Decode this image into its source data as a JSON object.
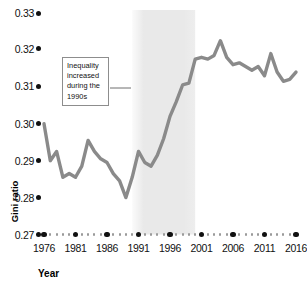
{
  "chart_data": {
    "type": "line",
    "title": "",
    "xlabel": "Year",
    "ylabel": "Gini ratio",
    "ylim": [
      0.27,
      0.335
    ],
    "xlim": [
      1976,
      2016
    ],
    "grid": false,
    "legend": null,
    "y_ticks": [
      "0.33",
      "0.32",
      "0.31",
      "0.30",
      "0.29",
      "0.28",
      "0.27"
    ],
    "y_tick_values": [
      0.33,
      0.32,
      0.31,
      0.3,
      0.29,
      0.28,
      0.27
    ],
    "x_ticks": [
      "1976",
      "1981",
      "1986",
      "1991",
      "1996",
      "2001",
      "2006",
      "2011",
      "2016"
    ],
    "x_tick_values": [
      1976,
      1981,
      1986,
      1991,
      1996,
      2001,
      2006,
      2011,
      2016
    ],
    "series": [
      {
        "name": "Gini ratio",
        "color": "#8a8a8a",
        "x": [
          1976,
          1977,
          1978,
          1979,
          1980,
          1981,
          1982,
          1983,
          1984,
          1985,
          1986,
          1987,
          1988,
          1989,
          1990,
          1991,
          1992,
          1993,
          1994,
          1995,
          1996,
          1997,
          1998,
          1999,
          2000,
          2001,
          2002,
          2003,
          2004,
          2005,
          2006,
          2007,
          2008,
          2009,
          2010,
          2011,
          2012,
          2013,
          2014,
          2015,
          2016
        ],
        "values": [
          0.3,
          0.29,
          0.2925,
          0.2855,
          0.2865,
          0.2855,
          0.2885,
          0.2955,
          0.2925,
          0.2905,
          0.2895,
          0.2865,
          0.2845,
          0.28,
          0.2855,
          0.2925,
          0.2895,
          0.2885,
          0.2915,
          0.296,
          0.302,
          0.306,
          0.3105,
          0.311,
          0.3175,
          0.318,
          0.3175,
          0.3185,
          0.3225,
          0.318,
          0.316,
          0.3165,
          0.3155,
          0.3145,
          0.3155,
          0.313,
          0.319,
          0.314,
          0.3115,
          0.312,
          0.314
        ]
      }
    ],
    "shaded_region": {
      "label": "1990s",
      "x_start": 1990,
      "x_end": 2000,
      "color": "#ececec"
    },
    "annotation": {
      "lines": [
        "Inequality",
        "increased",
        "during the",
        "1990s"
      ],
      "text": "Inequality increased during the 1990s"
    }
  },
  "colors": {
    "line": "#8a8a8a",
    "axis_text": "#111111",
    "shade": "#ececec",
    "minor_dot": "#9a9a9a",
    "box_border": "#8d8d8d"
  }
}
